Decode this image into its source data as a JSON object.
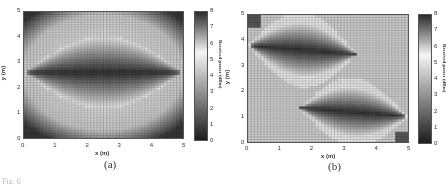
{
  "figure": {
    "caption_partial": "Fig. 6",
    "panels": [
      {
        "id": "a",
        "caption": "(a)"
      },
      {
        "id": "b",
        "caption": "(b)"
      }
    ]
  },
  "chart_data": [
    {
      "type": "heatmap",
      "title": "(a)",
      "xlabel": "x (m)",
      "ylabel": "y (m)",
      "colorbar_label": "Received power (dBm)",
      "xlim": [
        0,
        5
      ],
      "ylim": [
        0,
        5
      ],
      "xticks": [
        "0",
        "1",
        "2",
        "3",
        "4",
        "5"
      ],
      "yticks": [
        "0",
        "1",
        "2",
        "3",
        "4",
        "5"
      ],
      "colorbar_ticks": [
        "0",
        "1",
        "2",
        "3",
        "4",
        "5",
        "6",
        "7",
        "8"
      ],
      "colorbar_range": [
        0,
        8
      ],
      "grid_cells": [
        50,
        50
      ],
      "grid": true,
      "pattern": "two dark elliptical lobes centered at (1.5,2.6) and (3.6,2.6) merging to dark cusps at x=0 and x=5 along y≈2.6; bright ring surrounding lobes; dark corners",
      "sources": [
        {
          "x": 0,
          "y": 2.6
        },
        {
          "x": 5,
          "y": 2.6
        }
      ]
    },
    {
      "type": "heatmap",
      "title": "(b)",
      "xlabel": "x (m)",
      "ylabel": "y (m)",
      "colorbar_label": "Received power (dBm)",
      "xlim": [
        0,
        5
      ],
      "ylim": [
        0,
        5
      ],
      "xticks": [
        "0",
        "1",
        "2",
        "3",
        "4",
        "5"
      ],
      "yticks": [
        "0",
        "1",
        "2",
        "3",
        "4",
        "5"
      ],
      "colorbar_ticks": [
        "0",
        "1",
        "2",
        "3",
        "4",
        "5",
        "6",
        "7",
        "8"
      ],
      "colorbar_range": [
        0,
        8
      ],
      "grid_cells": [
        50,
        50
      ],
      "grid": true,
      "pattern": "dark lobe from cusp at (0,3.8) extending right to ~x=3; dark lobe from cusp at (5,1.0) extending left to ~x=2; bright bands bordering lobes; light background elsewhere",
      "sources": [
        {
          "x": 0,
          "y": 3.8
        },
        {
          "x": 5,
          "y": 1.0
        }
      ]
    }
  ]
}
